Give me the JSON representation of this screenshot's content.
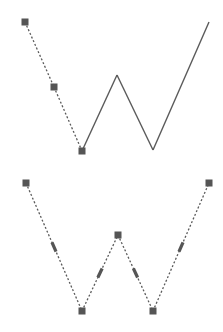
{
  "colors": {
    "background": "#ffffff",
    "line": "#5a5a5a",
    "handle": "#555555"
  },
  "diagrams": [
    {
      "name": "partially-converted-path",
      "points": [
        [
          25,
          22
        ],
        [
          54,
          87
        ],
        [
          82,
          151
        ],
        [
          117,
          75
        ],
        [
          153,
          150
        ],
        [
          209,
          22
        ]
      ],
      "handles": [
        [
          25,
          22
        ],
        [
          54,
          87
        ],
        [
          82,
          151
        ]
      ],
      "dashed_segments": [
        [
          0,
          1
        ],
        [
          1,
          2
        ]
      ],
      "solid_segments": [
        [
          2,
          3
        ],
        [
          3,
          4
        ],
        [
          4,
          5
        ]
      ],
      "midpoint_handles": []
    },
    {
      "name": "fully-converted-path",
      "points": [
        [
          26,
          183
        ],
        [
          82,
          311
        ],
        [
          118,
          235
        ],
        [
          153,
          311
        ],
        [
          209,
          183
        ]
      ],
      "handles": [
        [
          26,
          183
        ],
        [
          82,
          311
        ],
        [
          118,
          235
        ],
        [
          153,
          311
        ],
        [
          209,
          183
        ]
      ],
      "dashed_segments": [
        [
          0,
          1
        ],
        [
          1,
          2
        ],
        [
          2,
          3
        ],
        [
          3,
          4
        ]
      ],
      "solid_segments": [],
      "midpoint_handles": [
        [
          0,
          1
        ],
        [
          1,
          2
        ],
        [
          2,
          3
        ],
        [
          3,
          4
        ]
      ]
    }
  ]
}
